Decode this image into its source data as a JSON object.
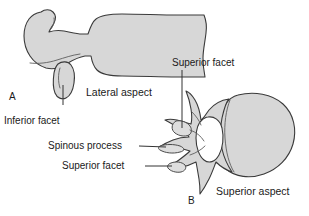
{
  "figure": {
    "background_color": "#ffffff",
    "bone_fill_color": "#d7d7d7",
    "bone_outline_color": "#3a3a3a",
    "foramen_fill_color": "#ffffff",
    "leader_line_color": "#333333",
    "text_color": "#1a1a1a"
  },
  "panels": {
    "a": {
      "letter": "A",
      "caption": "Lateral aspect"
    },
    "b": {
      "letter": "B",
      "caption": "Superior aspect"
    }
  },
  "labels": {
    "inferior_facet": "Inferior facet",
    "superior_facet_top": "Superior facet",
    "spinous_process": "Spinous process",
    "superior_facet_lower": "Superior facet"
  }
}
